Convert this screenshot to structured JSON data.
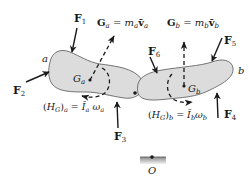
{
  "figure": {
    "colors": {
      "body_fill": "#dcdcdc",
      "body_stroke": "#555555",
      "ink": "#1a1a1a",
      "ground_fill": "#9a9a9a"
    }
  },
  "bodies": {
    "a": {
      "label": "a",
      "center_label": "G",
      "center_sub": "a"
    },
    "b": {
      "label": "b",
      "center_label": "G",
      "center_sub": "b"
    }
  },
  "forces": [
    {
      "id": "F1",
      "symbol": "F",
      "sub": "1"
    },
    {
      "id": "F2",
      "symbol": "F",
      "sub": "2"
    },
    {
      "id": "F3",
      "symbol": "F",
      "sub": "3"
    },
    {
      "id": "F4",
      "symbol": "F",
      "sub": "4"
    },
    {
      "id": "F5",
      "symbol": "F",
      "sub": "5"
    },
    {
      "id": "F6",
      "symbol": "F",
      "sub": "6"
    }
  ],
  "momenta": {
    "linear_a": {
      "lhs": "G",
      "lhs_sub": "a",
      "eq": " = ",
      "m": "m",
      "m_sub": "a",
      "v": "v̄",
      "v_sub": "a"
    },
    "linear_b": {
      "lhs": "G",
      "lhs_sub": "b",
      "eq": " = ",
      "m": "m",
      "m_sub": "b",
      "v": "v̄",
      "v_sub": "b"
    },
    "angular_a": {
      "lhs_open": "(",
      "H": "H",
      "H_sub": "G",
      "lhs_close": ")",
      "lhs_sub": "a",
      "eq": " = ",
      "I": "Ī",
      "I_sub": "a",
      "w": "ω",
      "w_sub": "a"
    },
    "angular_b": {
      "lhs_open": "(",
      "H": "H",
      "H_sub": "G",
      "lhs_close": ")",
      "lhs_sub": "b",
      "eq": " = ",
      "I": "Ī",
      "I_sub": "b",
      "w": "ω",
      "w_sub": "b"
    }
  },
  "reference_point": {
    "label": "O"
  }
}
